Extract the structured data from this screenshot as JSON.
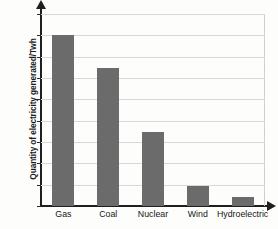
{
  "chart_data": {
    "type": "bar",
    "title": "",
    "xlabel": "",
    "ylabel": "Quantity of electricity generated/Twh",
    "categories": [
      "Gas",
      "Coal",
      "Nuclear",
      "Wind",
      "Hydroelectric"
    ],
    "values": [
      160,
      129,
      69,
      19,
      8
    ],
    "ylim": [
      0,
      180
    ],
    "ytick_labels": [
      "0",
      "20",
      "40",
      "60",
      "80",
      "100",
      "120",
      "140",
      "160",
      "180"
    ],
    "ytick_values": [
      0,
      20,
      40,
      60,
      80,
      100,
      120,
      140,
      160,
      180
    ],
    "grid": true,
    "legend": null,
    "bar_color": "#6b6b6b",
    "gridline_color": "#d8d8d8",
    "axis_color": "#1f1f1f",
    "background_color": "#fdfdfc",
    "series": [
      {
        "name": "Quantity of electricity generated/Twh",
        "values": [
          160,
          129,
          69,
          19,
          8
        ]
      }
    ]
  }
}
